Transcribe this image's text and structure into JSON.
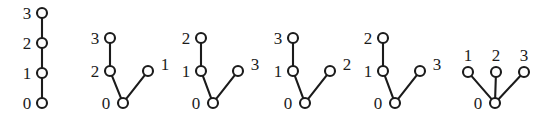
{
  "figure": {
    "background_color": "#ffffff",
    "stroke_color": "#1b1b1b",
    "node_fill_color": "#ffffff",
    "node_radius": 5,
    "label_font_size": 17,
    "trees": [
      {
        "name": "tree-1",
        "description": "path 0-1-2-3",
        "nodes": [
          {
            "id": "t1n0",
            "label": "0",
            "x": 42,
            "y": 103,
            "label_x": 27,
            "label_y": 109,
            "label_anchor": "middle"
          },
          {
            "id": "t1n1",
            "label": "1",
            "x": 42,
            "y": 73,
            "label_x": 27,
            "label_y": 79,
            "label_anchor": "middle"
          },
          {
            "id": "t1n2",
            "label": "2",
            "x": 42,
            "y": 43,
            "label_x": 27,
            "label_y": 49,
            "label_anchor": "middle"
          },
          {
            "id": "t1n3",
            "label": "3",
            "x": 42,
            "y": 13,
            "label_x": 27,
            "label_y": 19,
            "label_anchor": "middle"
          }
        ],
        "edges": [
          {
            "from": "t1n0",
            "to": "t1n1"
          },
          {
            "from": "t1n1",
            "to": "t1n2"
          },
          {
            "from": "t1n2",
            "to": "t1n3"
          }
        ]
      },
      {
        "name": "tree-2",
        "description": "root 0 with children 2 and 1; 2 has child 3",
        "nodes": [
          {
            "id": "t2n0",
            "label": "0",
            "x": 123,
            "y": 103,
            "label_x": 106,
            "label_y": 109,
            "label_anchor": "middle"
          },
          {
            "id": "t2n2",
            "label": "2",
            "x": 110,
            "y": 71,
            "label_x": 95,
            "label_y": 77,
            "label_anchor": "middle"
          },
          {
            "id": "t2n1",
            "label": "1",
            "x": 148,
            "y": 71,
            "label_x": 165,
            "label_y": 70,
            "label_anchor": "middle"
          },
          {
            "id": "t2n3",
            "label": "3",
            "x": 110,
            "y": 38,
            "label_x": 95,
            "label_y": 44,
            "label_anchor": "middle"
          }
        ],
        "edges": [
          {
            "from": "t2n0",
            "to": "t2n2"
          },
          {
            "from": "t2n0",
            "to": "t2n1"
          },
          {
            "from": "t2n2",
            "to": "t2n3"
          }
        ]
      },
      {
        "name": "tree-3",
        "description": "root 0 with children 1 and 3; 1 has child 2",
        "nodes": [
          {
            "id": "t3n0",
            "label": "0",
            "x": 213,
            "y": 103,
            "label_x": 196,
            "label_y": 109,
            "label_anchor": "middle"
          },
          {
            "id": "t3n1",
            "label": "1",
            "x": 201,
            "y": 71,
            "label_x": 186,
            "label_y": 77,
            "label_anchor": "middle"
          },
          {
            "id": "t3n3",
            "label": "3",
            "x": 238,
            "y": 71,
            "label_x": 255,
            "label_y": 70,
            "label_anchor": "middle"
          },
          {
            "id": "t3n2",
            "label": "2",
            "x": 201,
            "y": 38,
            "label_x": 186,
            "label_y": 44,
            "label_anchor": "middle"
          }
        ],
        "edges": [
          {
            "from": "t3n0",
            "to": "t3n1"
          },
          {
            "from": "t3n0",
            "to": "t3n3"
          },
          {
            "from": "t3n1",
            "to": "t3n2"
          }
        ]
      },
      {
        "name": "tree-4",
        "description": "root 0 with children 1 and 2; 1 has child 3",
        "nodes": [
          {
            "id": "t4n0",
            "label": "0",
            "x": 305,
            "y": 103,
            "label_x": 288,
            "label_y": 109,
            "label_anchor": "middle"
          },
          {
            "id": "t4n1",
            "label": "1",
            "x": 293,
            "y": 71,
            "label_x": 278,
            "label_y": 77,
            "label_anchor": "middle"
          },
          {
            "id": "t4n2",
            "label": "2",
            "x": 330,
            "y": 71,
            "label_x": 347,
            "label_y": 70,
            "label_anchor": "middle"
          },
          {
            "id": "t4n3",
            "label": "3",
            "x": 293,
            "y": 38,
            "label_x": 278,
            "label_y": 44,
            "label_anchor": "middle"
          }
        ],
        "edges": [
          {
            "from": "t4n0",
            "to": "t4n1"
          },
          {
            "from": "t4n0",
            "to": "t4n2"
          },
          {
            "from": "t4n1",
            "to": "t4n3"
          }
        ]
      },
      {
        "name": "tree-5",
        "description": "root 0 with children 1 and 3; 1 has child 2",
        "nodes": [
          {
            "id": "t5n0",
            "label": "0",
            "x": 395,
            "y": 103,
            "label_x": 378,
            "label_y": 109,
            "label_anchor": "middle"
          },
          {
            "id": "t5n1",
            "label": "1",
            "x": 383,
            "y": 71,
            "label_x": 368,
            "label_y": 77,
            "label_anchor": "middle"
          },
          {
            "id": "t5n3",
            "label": "3",
            "x": 420,
            "y": 71,
            "label_x": 437,
            "label_y": 70,
            "label_anchor": "middle"
          },
          {
            "id": "t5n2",
            "label": "2",
            "x": 383,
            "y": 38,
            "label_x": 368,
            "label_y": 44,
            "label_anchor": "middle"
          }
        ],
        "edges": [
          {
            "from": "t5n0",
            "to": "t5n1"
          },
          {
            "from": "t5n0",
            "to": "t5n3"
          },
          {
            "from": "t5n1",
            "to": "t5n2"
          }
        ]
      },
      {
        "name": "tree-6",
        "description": "star: root 0 with children 1, 2 and 3",
        "nodes": [
          {
            "id": "t6n0",
            "label": "0",
            "x": 495,
            "y": 103,
            "label_x": 478,
            "label_y": 109,
            "label_anchor": "middle"
          },
          {
            "id": "t6n1",
            "label": "1",
            "x": 468,
            "y": 72,
            "label_x": 468,
            "label_y": 61,
            "label_anchor": "middle"
          },
          {
            "id": "t6n2",
            "label": "2",
            "x": 496,
            "y": 72,
            "label_x": 496,
            "label_y": 61,
            "label_anchor": "middle"
          },
          {
            "id": "t6n3",
            "label": "3",
            "x": 524,
            "y": 72,
            "label_x": 524,
            "label_y": 61,
            "label_anchor": "middle"
          }
        ],
        "edges": [
          {
            "from": "t6n0",
            "to": "t6n1"
          },
          {
            "from": "t6n0",
            "to": "t6n2"
          },
          {
            "from": "t6n0",
            "to": "t6n3"
          }
        ]
      }
    ]
  }
}
